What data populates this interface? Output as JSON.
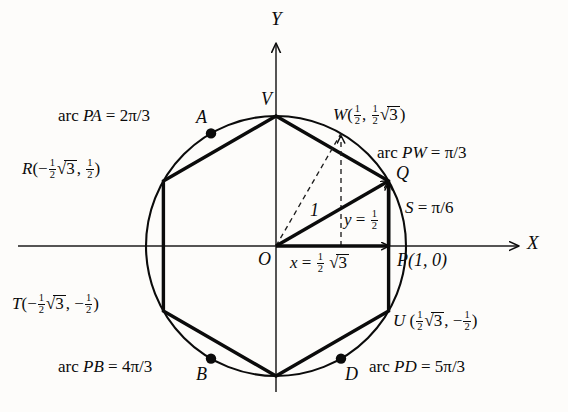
{
  "figure": {
    "kind": "unit-circle-with-inscribed-hexagon",
    "axes": {
      "x_label": "X",
      "y_label": "Y",
      "origin_label": "O"
    },
    "circle": {
      "center": [
        0,
        0
      ],
      "radius": 1
    },
    "points": {
      "P": {
        "label": "P(1, 0)",
        "name": "P",
        "coords": [
          1,
          0
        ],
        "angle_deg": 0
      },
      "Q": {
        "label": "Q",
        "name": "Q",
        "coords": [
          0.8660254,
          0.5
        ],
        "angle_deg": 30
      },
      "W": {
        "label": "W",
        "name": "W",
        "coords": [
          0.5,
          0.8660254
        ],
        "angle_deg": 60
      },
      "V": {
        "label": "V",
        "name": "V",
        "coords": [
          0,
          1
        ],
        "angle_deg": 90
      },
      "R": {
        "label": "R",
        "name": "R",
        "coords": [
          -0.8660254,
          0.5
        ],
        "angle_deg": 150
      },
      "T": {
        "label": "T",
        "name": "T",
        "coords": [
          -0.8660254,
          -0.5
        ],
        "angle_deg": 210
      },
      "U": {
        "label": "U",
        "name": "U",
        "coords": [
          0.8660254,
          -0.5
        ],
        "angle_deg": 330
      },
      "A": {
        "label": "A",
        "name": "A",
        "angle_deg": 120
      },
      "B": {
        "label": "B",
        "name": "B",
        "angle_deg": 240
      },
      "D": {
        "label": "D",
        "name": "D",
        "angle_deg": 300
      }
    },
    "annotations": {
      "arc_PA": {
        "lead": "arc",
        "pair": "PA",
        "eq": "=",
        "value_num": "2",
        "value_pi": "π",
        "value_den": "/3",
        "full": "arc PA = 2π/3"
      },
      "arc_PW": {
        "lead": "arc",
        "pair": "PW",
        "eq": "=",
        "value_pi": "π",
        "value_den": "/3",
        "full": "arc PW = π/3"
      },
      "arc_PB": {
        "lead": "arc",
        "pair": "PB",
        "eq": "=",
        "value_num": "4",
        "value_pi": "π",
        "value_den": "/3",
        "full": "arc PB = 4π/3"
      },
      "arc_PD": {
        "lead": "arc",
        "pair": "PD",
        "eq": "=",
        "value_num": "5",
        "value_pi": "π",
        "value_den": "/3",
        "full": "arc PD = 5π/3"
      },
      "arc_S": {
        "name": "S",
        "eq": "=",
        "value_pi": "π",
        "value_den": "/6",
        "full": "S = π/6"
      },
      "hypotenuse": {
        "value": "1"
      },
      "leg_x": {
        "var": "x",
        "eq": "=",
        "value": "½√3",
        "full": "x = 1/2 √3"
      },
      "leg_y": {
        "var": "y",
        "eq": "=",
        "value": "½",
        "full": "y = 1/2"
      }
    },
    "coord_labels": {
      "W": {
        "name": "W",
        "open": "(",
        "x_num": "1",
        "x_den": "2",
        "comma": ",",
        "y_num": "1",
        "y_den": "2",
        "radicand": "3",
        "close": ")",
        "full": "W(1/2 , 1/2 √3 )"
      },
      "R": {
        "name": "R",
        "open": "(",
        "minus": "−",
        "x_num": "1",
        "x_den": "2",
        "radicand": "3",
        "comma": ",",
        "y_num": "1",
        "y_den": "2",
        "close": ")",
        "full": "R(− 1/2 √3, 1/2 )"
      },
      "T": {
        "name": "T",
        "open": "(",
        "minus": "−",
        "x_num": "1",
        "x_den": "2",
        "radicand": "3",
        "comma": ",",
        "minus2": "−",
        "y_num": "1",
        "y_den": "2",
        "close": ")",
        "full": "T(− 1/2 √3, − 1/2 )"
      },
      "U": {
        "name": "U",
        "open": "(",
        "x_num": "1",
        "x_den": "2",
        "radicand": "3",
        "comma": ",",
        "minus2": "−",
        "y_num": "1",
        "y_den": "2",
        "close": ")",
        "full": "U(1/2 √3 , − 1/2 )"
      }
    },
    "colors": {
      "ink": "#0b0b0b",
      "paper": "#fdfcfa",
      "thin": "#2b2b2b"
    }
  }
}
